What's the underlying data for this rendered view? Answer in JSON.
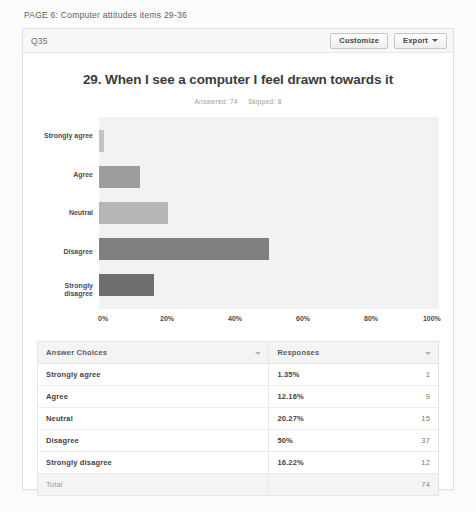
{
  "page_heading": "PAGE 6: Computer attitudes items 29-36",
  "card": {
    "question_label": "Q35",
    "customize_label": "Customize",
    "export_label": "Export"
  },
  "chart_data": {
    "type": "bar",
    "orientation": "horizontal",
    "title": "29. When I see a computer I feel drawn towards it",
    "answered_label": "Answered: 74",
    "skipped_label": "Skipped: 8",
    "categories": [
      "Strongly agree",
      "Agree",
      "Neutral",
      "Disagree",
      "Strongly disagree"
    ],
    "values": [
      1.35,
      12.16,
      20.27,
      50,
      16.22
    ],
    "counts": [
      1,
      9,
      15,
      37,
      12
    ],
    "value_labels": [
      "1.35%",
      "12.16%",
      "20.27%",
      "50%",
      "16.22%"
    ],
    "xlabel": "",
    "ylabel": "",
    "xlim": [
      0,
      100
    ],
    "xticks": [
      "0%",
      "20%",
      "40%",
      "60%",
      "80%",
      "100%"
    ],
    "grid": false,
    "legend": "none",
    "bar_colors": [
      "#c3c3c3",
      "#9d9d9d",
      "#b6b6b6",
      "#7f7f7f",
      "#6e6e6e"
    ],
    "plot_background": "#f2f2f2"
  },
  "table": {
    "headers": [
      "Answer Choices",
      "Responses"
    ],
    "rows": [
      {
        "choice": "Strongly agree",
        "percent": "1.35%",
        "count": "1"
      },
      {
        "choice": "Agree",
        "percent": "12.16%",
        "count": "9"
      },
      {
        "choice": "Neutral",
        "percent": "20.27%",
        "count": "15"
      },
      {
        "choice": "Disagree",
        "percent": "50%",
        "count": "37"
      },
      {
        "choice": "Strongly disagree",
        "percent": "16.22%",
        "count": "12"
      }
    ],
    "total_label": "Total",
    "total_count": "74"
  }
}
